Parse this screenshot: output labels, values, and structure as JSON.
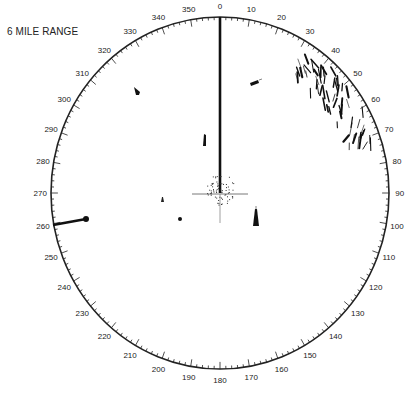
{
  "title": "6 MILE RANGE",
  "display": {
    "center": [
      220,
      193
    ],
    "radius_x": 169,
    "radius_y": 176,
    "ring_color": "#222222",
    "heading_flash_deg": 0,
    "bearing_labels": [
      "0",
      "10",
      "20",
      "30",
      "40",
      "50",
      "60",
      "70",
      "80",
      "90",
      "100",
      "110",
      "120",
      "130",
      "140",
      "150",
      "160",
      "170",
      "180",
      "190",
      "200",
      "210",
      "220",
      "230",
      "240",
      "250",
      "260",
      "270",
      "280",
      "290",
      "300",
      "310",
      "320",
      "330",
      "340",
      "350"
    ]
  },
  "targets": [
    {
      "id": "target-nw",
      "x": 136,
      "y": 91,
      "shape": "blip"
    },
    {
      "id": "target-ne",
      "x": 254,
      "y": 83,
      "shape": "blip-with-tail"
    },
    {
      "id": "target-near-heading",
      "x": 204,
      "y": 140,
      "shape": "blip"
    },
    {
      "id": "target-small-west",
      "x": 162,
      "y": 200,
      "shape": "small"
    },
    {
      "id": "target-southwest",
      "x": 180,
      "y": 218,
      "shape": "dot"
    },
    {
      "id": "target-southeast",
      "x": 256,
      "y": 220,
      "shape": "blip"
    }
  ],
  "ebl": {
    "bearing_deg": 260,
    "inner_x": 86,
    "inner_y": 219,
    "outer_x": 53,
    "outer_y": 225
  },
  "land_echo": {
    "bearing_start_deg": 30,
    "bearing_end_deg": 72
  }
}
